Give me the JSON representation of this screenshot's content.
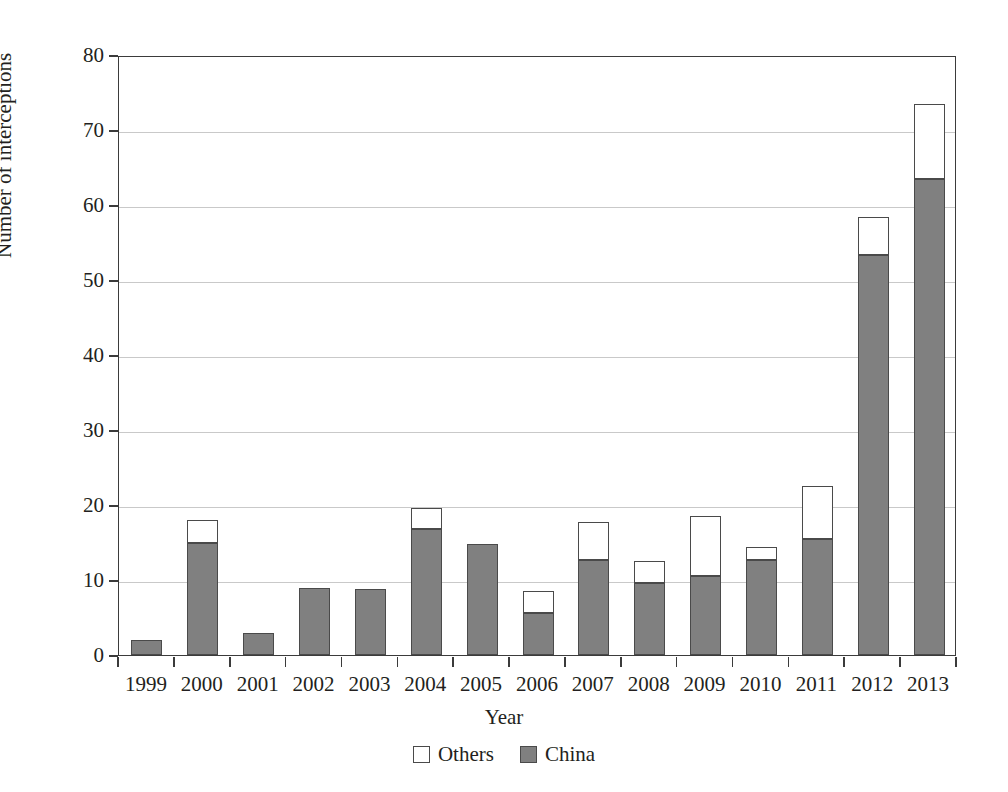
{
  "chart_data": {
    "type": "bar",
    "stacked": true,
    "title": "",
    "xlabel": "Year",
    "ylabel": "Number of interceptions",
    "ylim": [
      0,
      80
    ],
    "ytick_values": [
      0,
      10,
      20,
      30,
      40,
      50,
      60,
      70,
      80
    ],
    "ytick_labels": [
      "0",
      "10",
      "20",
      "30",
      "40",
      "50",
      "60",
      "70",
      "80"
    ],
    "grid": true,
    "grid_axis": "y",
    "legend_position": "bottom",
    "categories": [
      "1999",
      "2000",
      "2001",
      "2002",
      "2003",
      "2004",
      "2005",
      "2006",
      "2007",
      "2008",
      "2009",
      "2010",
      "2011",
      "2012",
      "2013"
    ],
    "series": [
      {
        "name": "China",
        "color": "#808080",
        "values": [
          2.0,
          14.9,
          3.0,
          8.9,
          8.8,
          16.8,
          14.8,
          5.6,
          12.7,
          9.6,
          10.5,
          12.7,
          15.5,
          53.4,
          63.5
        ]
      },
      {
        "name": "Others",
        "color": "#ffffff",
        "values": [
          0.0,
          3.1,
          0.0,
          0.0,
          0.0,
          2.8,
          0.0,
          2.9,
          5.1,
          2.9,
          8.1,
          1.7,
          7.0,
          5.0,
          10.0
        ]
      }
    ],
    "totals": [
      2.0,
      18.0,
      3.0,
      8.9,
      8.8,
      19.6,
      14.8,
      8.5,
      17.8,
      12.5,
      18.6,
      14.4,
      22.5,
      58.4,
      73.5
    ]
  },
  "legend": {
    "items": [
      {
        "label": "Others",
        "swatch": "white-square-swatch"
      },
      {
        "label": "China",
        "swatch": "gray-square-swatch"
      }
    ]
  },
  "axes": {
    "x_title": "Year",
    "y_title": "Number of interceptions"
  }
}
